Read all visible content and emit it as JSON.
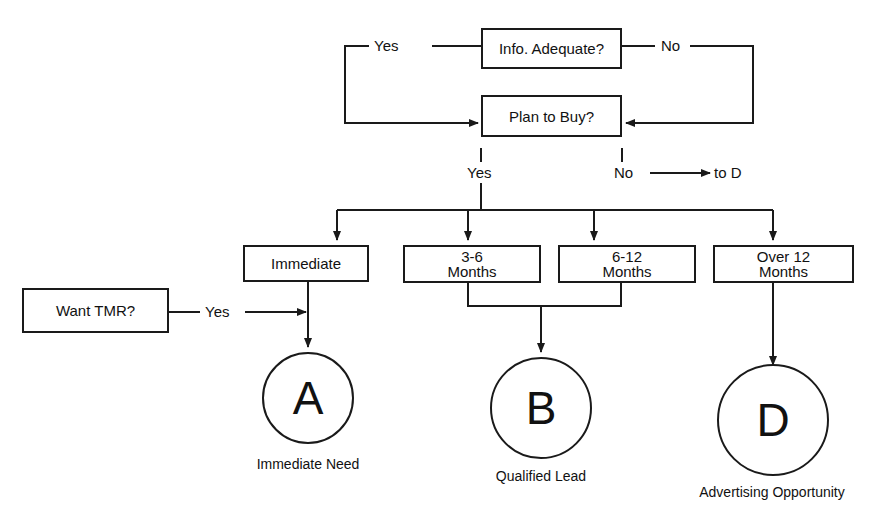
{
  "diagram": {
    "decisions": {
      "info_adequate": "Info. Adequate?",
      "plan_to_buy": "Plan to Buy?",
      "want_tmr": "Want TMR?"
    },
    "branch_labels": {
      "info_yes": "Yes",
      "info_no": "No",
      "plan_yes": "Yes",
      "plan_no": "No",
      "plan_no_target": "to D",
      "tmr_yes": "Yes"
    },
    "timeframes": [
      {
        "line1": "Immediate",
        "line2": ""
      },
      {
        "line1": "3-6",
        "line2": "Months"
      },
      {
        "line1": "6-12",
        "line2": "Months"
      },
      {
        "line1": "Over 12",
        "line2": "Months"
      }
    ],
    "outcomes": [
      {
        "letter": "A",
        "caption": "Immediate Need"
      },
      {
        "letter": "B",
        "caption": "Qualified Lead"
      },
      {
        "letter": "D",
        "caption": "Advertising Opportunity"
      }
    ]
  }
}
